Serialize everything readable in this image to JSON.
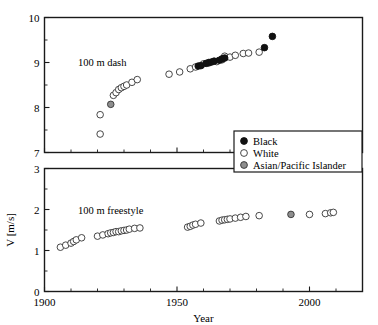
{
  "chart_data": {
    "type": "scatter",
    "title": "",
    "xlabel": "Year",
    "ylabel": "V [m/s]",
    "xlim": [
      1900,
      2020
    ],
    "xticks": [
      1900,
      1950,
      2000
    ],
    "xtick_labels": [
      "1900",
      "1950",
      "2000"
    ],
    "xminor_step": 10,
    "grid": false,
    "legend": {
      "position": "upper-right-of-top-panel",
      "entries": [
        {
          "label": "Black",
          "marker": "filled-circle",
          "color": "#111111"
        },
        {
          "label": "White",
          "marker": "open-circle",
          "color": "#ffffff"
        },
        {
          "label": "Asian/Pacific Islander",
          "marker": "gray-circle",
          "color": "#8e8e8e"
        }
      ]
    },
    "panels": [
      {
        "name": "dash",
        "annotation": "100 m dash",
        "ylim": [
          7,
          10
        ],
        "yticks": [
          7,
          8,
          9,
          10
        ],
        "ytick_labels": [
          "7",
          "8",
          "9",
          "10"
        ],
        "yminor_step": 0.5,
        "series": [
          {
            "name": "White",
            "marker": "open-circle",
            "points": [
              [
                1921,
                7.41
              ],
              [
                1921,
                7.84
              ],
              [
                1926,
                8.27
              ],
              [
                1927,
                8.33
              ],
              [
                1928,
                8.4
              ],
              [
                1929,
                8.44
              ],
              [
                1930,
                8.47
              ],
              [
                1931,
                8.5
              ],
              [
                1933,
                8.56
              ],
              [
                1935,
                8.62
              ],
              [
                1947,
                8.74
              ],
              [
                1951,
                8.79
              ],
              [
                1955,
                8.86
              ],
              [
                1957,
                8.9
              ],
              [
                1960,
                8.97
              ],
              [
                1962,
                8.99
              ],
              [
                1965,
                9.02
              ],
              [
                1967,
                9.06
              ],
              [
                1968,
                9.11
              ],
              [
                1968,
                9.14
              ],
              [
                1970,
                9.12
              ],
              [
                1972,
                9.16
              ],
              [
                1975,
                9.2
              ],
              [
                1977,
                9.21
              ],
              [
                1981,
                9.23
              ]
            ]
          },
          {
            "name": "Black",
            "marker": "filled-circle",
            "points": [
              [
                1958,
                8.92
              ],
              [
                1959,
                8.93
              ],
              [
                1961,
                8.98
              ],
              [
                1962,
                9.0
              ],
              [
                1963,
                9.01
              ],
              [
                1964,
                9.03
              ],
              [
                1966,
                9.05
              ],
              [
                1967,
                9.08
              ],
              [
                1968,
                9.1
              ],
              [
                1983,
                9.33
              ],
              [
                1986,
                9.58
              ]
            ]
          },
          {
            "name": "Asian/Pacific Islander",
            "marker": "gray-circle",
            "points": [
              [
                1925,
                8.07
              ]
            ]
          }
        ]
      },
      {
        "name": "freestyle",
        "annotation": "100 m freestyle",
        "ylim": [
          0,
          3
        ],
        "yticks": [
          0,
          1,
          2,
          3
        ],
        "ytick_labels": [
          "0",
          "1",
          "2",
          "3"
        ],
        "yminor_step": 0.5,
        "series": [
          {
            "name": "White",
            "marker": "open-circle",
            "points": [
              [
                1906,
                1.08
              ],
              [
                1908,
                1.13
              ],
              [
                1910,
                1.18
              ],
              [
                1911,
                1.22
              ],
              [
                1912,
                1.26
              ],
              [
                1914,
                1.31
              ],
              [
                1920,
                1.35
              ],
              [
                1922,
                1.38
              ],
              [
                1924,
                1.41
              ],
              [
                1925,
                1.43
              ],
              [
                1926,
                1.44
              ],
              [
                1927,
                1.46
              ],
              [
                1928,
                1.46
              ],
              [
                1929,
                1.48
              ],
              [
                1930,
                1.49
              ],
              [
                1931,
                1.5
              ],
              [
                1932,
                1.52
              ],
              [
                1934,
                1.54
              ],
              [
                1936,
                1.55
              ],
              [
                1954,
                1.57
              ],
              [
                1955,
                1.59
              ],
              [
                1956,
                1.62
              ],
              [
                1957,
                1.64
              ],
              [
                1959,
                1.67
              ],
              [
                1966,
                1.72
              ],
              [
                1967,
                1.74
              ],
              [
                1968,
                1.75
              ],
              [
                1969,
                1.76
              ],
              [
                1970,
                1.77
              ],
              [
                1972,
                1.79
              ],
              [
                1974,
                1.81
              ],
              [
                1976,
                1.83
              ],
              [
                1981,
                1.85
              ],
              [
                2000,
                1.88
              ],
              [
                2006,
                1.9
              ],
              [
                2008,
                1.92
              ],
              [
                2009,
                1.93
              ]
            ]
          },
          {
            "name": "Asian/Pacific Islander",
            "marker": "gray-circle",
            "points": [
              [
                1993,
                1.88
              ]
            ]
          }
        ]
      }
    ]
  }
}
